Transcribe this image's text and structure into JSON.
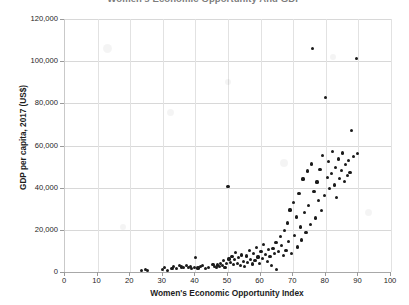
{
  "chart_data": {
    "type": "scatter",
    "title": "Women's Economic Opportunity And GDP",
    "xlabel": "Women's Economic Opportunity Index",
    "ylabel": "GDP per capita, 2017 (US$)",
    "xlim": [
      0,
      100
    ],
    "ylim": [
      0,
      120000
    ],
    "xticks": [
      0,
      10,
      20,
      30,
      40,
      50,
      60,
      70,
      80,
      90,
      100
    ],
    "xtick_labels": [
      "0",
      "10",
      "20",
      "30",
      "40",
      "50",
      "60",
      "70",
      "80",
      "90",
      "100"
    ],
    "yticks": [
      0,
      20000,
      40000,
      60000,
      80000,
      100000,
      120000
    ],
    "ytick_labels": [
      "0",
      "20,000",
      "40,000",
      "60,000",
      "80,000",
      "100,000",
      "120,000"
    ],
    "grid": true,
    "legend": false,
    "marker_color": "#1a1a1a",
    "series": [
      {
        "name": "Countries",
        "points": [
          [
            23.5,
            900
          ],
          [
            24.6,
            1100
          ],
          [
            25.4,
            600
          ],
          [
            29.8,
            1200
          ],
          [
            30.6,
            2300
          ],
          [
            31.4,
            900
          ],
          [
            32.8,
            1500
          ],
          [
            33.4,
            2600
          ],
          [
            34.2,
            1800
          ],
          [
            35.0,
            2900
          ],
          [
            35.8,
            2400
          ],
          [
            36.4,
            2200
          ],
          [
            37.2,
            3100
          ],
          [
            37.8,
            2000
          ],
          [
            38.4,
            2700
          ],
          [
            38.9,
            1500
          ],
          [
            39.6,
            2300
          ],
          [
            40.1,
            6800
          ],
          [
            40.8,
            1900
          ],
          [
            41.5,
            2500
          ],
          [
            42.3,
            3200
          ],
          [
            43.1,
            1600
          ],
          [
            44.0,
            2100
          ],
          [
            45.4,
            3600
          ],
          [
            45.9,
            2800
          ],
          [
            46.4,
            2100
          ],
          [
            46.9,
            3300
          ],
          [
            47.3,
            2600
          ],
          [
            47.8,
            4200
          ],
          [
            48.2,
            3000
          ],
          [
            48.7,
            5300
          ],
          [
            49.1,
            2300
          ],
          [
            49.6,
            3900
          ],
          [
            50.0,
            40700
          ],
          [
            50.3,
            6200
          ],
          [
            50.8,
            4600
          ],
          [
            51.2,
            7300
          ],
          [
            51.6,
            3400
          ],
          [
            52.0,
            5800
          ],
          [
            52.4,
            9300
          ],
          [
            52.9,
            4100
          ],
          [
            53.3,
            6700
          ],
          [
            53.8,
            3200
          ],
          [
            54.2,
            8100
          ],
          [
            54.7,
            5100
          ],
          [
            55.1,
            2700
          ],
          [
            55.6,
            7600
          ],
          [
            56.0,
            4400
          ],
          [
            56.5,
            10200
          ],
          [
            57.0,
            6100
          ],
          [
            57.4,
            3800
          ],
          [
            57.9,
            8700
          ],
          [
            58.3,
            5400
          ],
          [
            58.8,
            11800
          ],
          [
            59.2,
            7100
          ],
          [
            59.7,
            4200
          ],
          [
            60.1,
            9600
          ],
          [
            60.6,
            6400
          ],
          [
            61.0,
            13200
          ],
          [
            61.5,
            8200
          ],
          [
            62.0,
            5100
          ],
          [
            62.4,
            10700
          ],
          [
            62.9,
            7400
          ],
          [
            63.3,
            3100
          ],
          [
            63.8,
            11200
          ],
          [
            64.2,
            8800
          ],
          [
            64.7,
            14100
          ],
          [
            65.0,
            1200
          ],
          [
            65.5,
            9900
          ],
          [
            66.0,
            16800
          ],
          [
            66.4,
            12400
          ],
          [
            66.9,
            7800
          ],
          [
            67.3,
            19700
          ],
          [
            67.8,
            10300
          ],
          [
            68.2,
            23200
          ],
          [
            68.6,
            14600
          ],
          [
            69.0,
            29400
          ],
          [
            69.5,
            8600
          ],
          [
            70.0,
            33100
          ],
          [
            70.4,
            17200
          ],
          [
            70.9,
            26100
          ],
          [
            71.3,
            11900
          ],
          [
            71.8,
            37400
          ],
          [
            72.2,
            21300
          ],
          [
            72.6,
            15200
          ],
          [
            73.0,
            44100
          ],
          [
            73.5,
            28300
          ],
          [
            73.9,
            18600
          ],
          [
            74.3,
            47900
          ],
          [
            74.8,
            31700
          ],
          [
            75.2,
            22400
          ],
          [
            75.6,
            51200
          ],
          [
            76.0,
            105900
          ],
          [
            76.4,
            38200
          ],
          [
            76.9,
            25600
          ],
          [
            77.3,
            42700
          ],
          [
            77.8,
            33800
          ],
          [
            78.2,
            48600
          ],
          [
            78.6,
            29100
          ],
          [
            79.0,
            55100
          ],
          [
            79.5,
            36400
          ],
          [
            80.0,
            82800
          ],
          [
            80.4,
            44900
          ],
          [
            80.8,
            52300
          ],
          [
            81.2,
            39600
          ],
          [
            81.7,
            46800
          ],
          [
            82.1,
            57200
          ],
          [
            82.6,
            41300
          ],
          [
            83.0,
            49700
          ],
          [
            83.4,
            35200
          ],
          [
            83.9,
            53600
          ],
          [
            84.3,
            44200
          ],
          [
            84.8,
            48100
          ],
          [
            85.2,
            56400
          ],
          [
            85.7,
            42900
          ],
          [
            86.1,
            50800
          ],
          [
            86.6,
            45600
          ],
          [
            87.0,
            52900
          ],
          [
            87.4,
            47300
          ],
          [
            88.0,
            67100
          ],
          [
            88.6,
            54800
          ],
          [
            89.3,
            101400
          ],
          [
            89.8,
            56300
          ]
        ]
      }
    ]
  }
}
